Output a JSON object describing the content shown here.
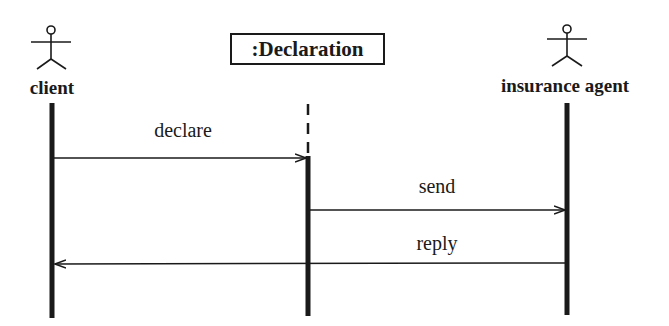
{
  "diagram": {
    "type": "sequence",
    "participants": [
      {
        "id": "client",
        "kind": "actor",
        "label": "client",
        "x": 52
      },
      {
        "id": "declaration",
        "kind": "object",
        "label": ":Declaration",
        "x": 308
      },
      {
        "id": "agent",
        "kind": "actor",
        "label": "insurance agent",
        "x": 567
      }
    ],
    "messages": [
      {
        "label": "declare",
        "from": "client",
        "to": "declaration",
        "y": 158
      },
      {
        "label": "send",
        "from": "declaration",
        "to": "agent",
        "y": 210
      },
      {
        "label": "reply",
        "from": "agent",
        "to": "client",
        "y": 263
      }
    ],
    "colors": {
      "stroke": "#1a1a1a",
      "background": "#ffffff"
    }
  }
}
